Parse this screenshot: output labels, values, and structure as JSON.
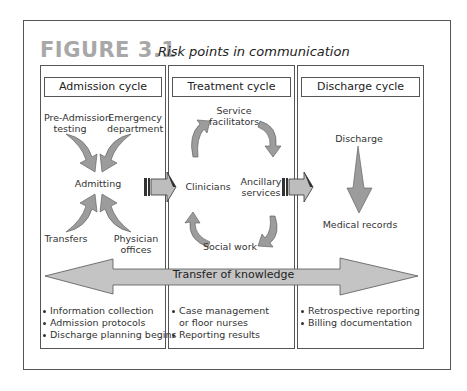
{
  "figure": {
    "number": "FIGURE 3.1",
    "title": "Risk points in communication"
  },
  "columns": [
    {
      "header": "Admission cycle",
      "nodes": {
        "top_left": [
          "Pre-Admission",
          "testing"
        ],
        "top_right": [
          "Emergency",
          "department"
        ],
        "center": "Admitting",
        "bottom_left": "Transfers",
        "bottom_right": [
          "Physician",
          "offices"
        ]
      },
      "bullets": [
        "Information collection",
        "Admission protocols",
        "Discharge planning begins"
      ]
    },
    {
      "header": "Treatment cycle",
      "nodes": {
        "top": [
          "Service",
          "facilitators"
        ],
        "left": "Clinicians",
        "right": [
          "Ancillary",
          "services"
        ],
        "bottom": "Social work"
      },
      "bullets": [
        [
          "Case management",
          "or floor nurses"
        ],
        "Reporting results"
      ]
    },
    {
      "header": "Discharge cycle",
      "nodes": {
        "top": "Discharge",
        "bottom": "Medical records"
      },
      "bullets": [
        "Retrospective reporting",
        "Billing documentation"
      ]
    }
  ],
  "banner": {
    "label": "Transfer of knowledge"
  },
  "colors": {
    "arrow_fill": "#a0a0a0",
    "arrow_stroke": "#555555",
    "banner_fill": "#c4c4c4",
    "figure_number": "#a8a8a8",
    "border": "#555555"
  }
}
